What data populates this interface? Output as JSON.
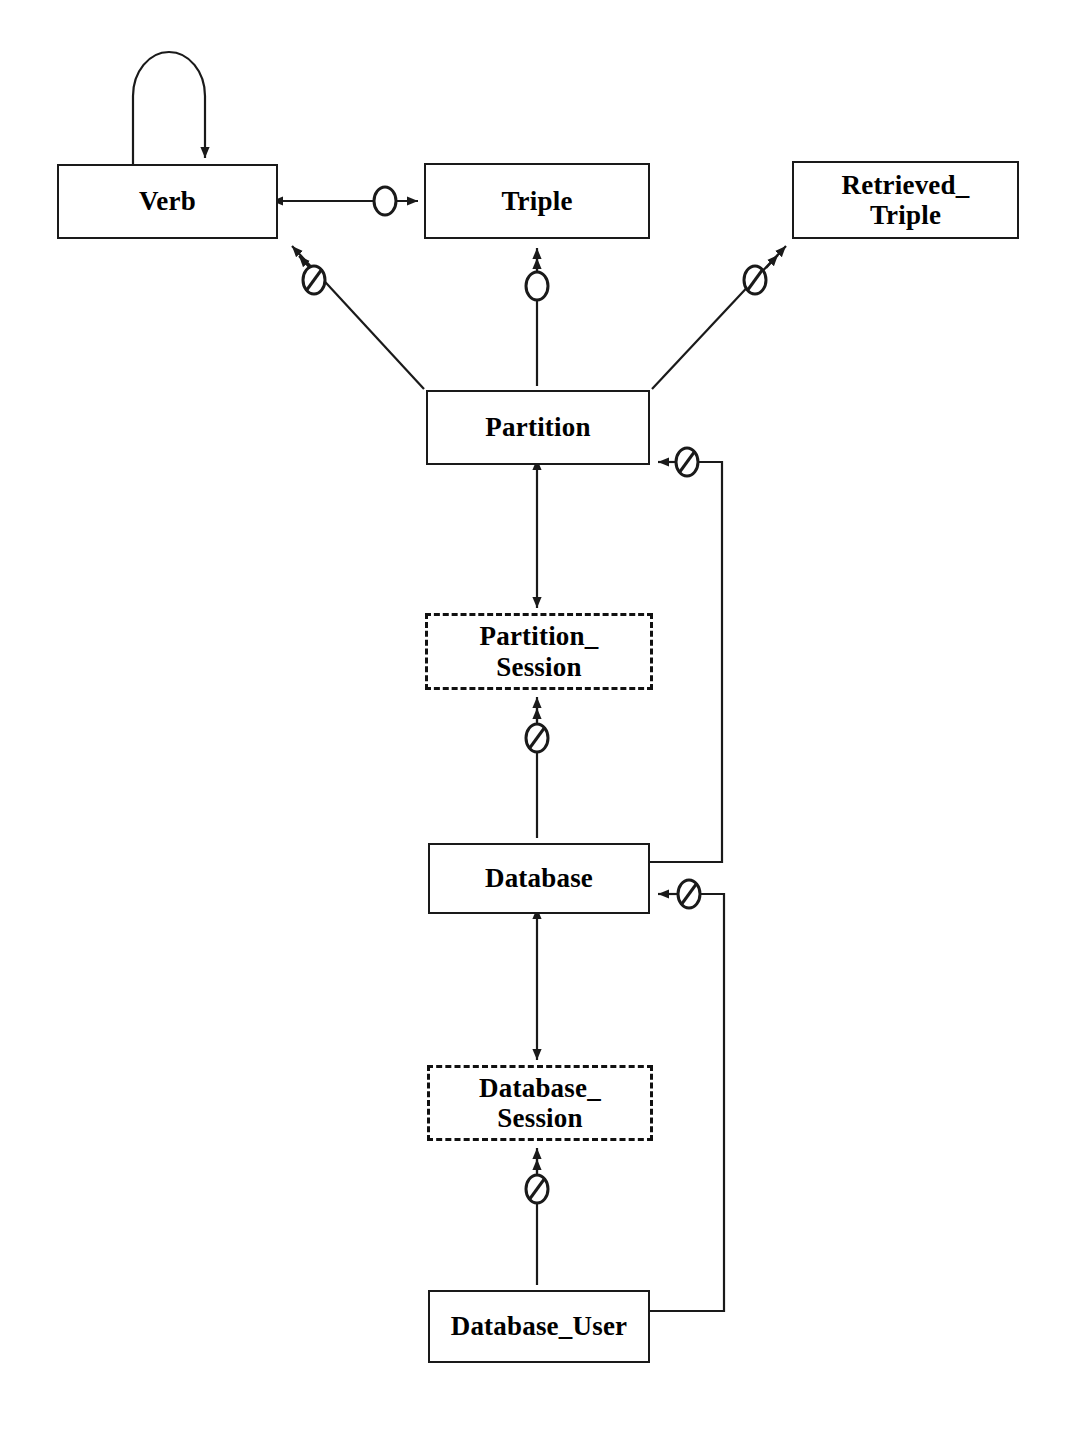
{
  "diagram": {
    "kind": "entity-relationship",
    "line_color": "#1a1a1a",
    "background_color": "#ffffff",
    "box_fill": "#ffffff",
    "text_color": "#000000",
    "entities": [
      {
        "id": "verb",
        "label": "Verb",
        "style": "solid",
        "x": 57,
        "y": 164,
        "width": 221,
        "height": 75
      },
      {
        "id": "triple",
        "label": "Triple",
        "style": "solid",
        "x": 424,
        "y": 163,
        "width": 226,
        "height": 76
      },
      {
        "id": "retrieved_triple",
        "label": "Retrieved_\nTriple",
        "style": "solid",
        "x": 792,
        "y": 161,
        "width": 227,
        "height": 78
      },
      {
        "id": "partition",
        "label": "Partition",
        "style": "solid",
        "x": 426,
        "y": 390,
        "width": 224,
        "height": 75
      },
      {
        "id": "partition_session",
        "label": "Partition_\nSession",
        "style": "dashed",
        "x": 425,
        "y": 613,
        "width": 228,
        "height": 77
      },
      {
        "id": "database",
        "label": "Database",
        "style": "solid",
        "x": 428,
        "y": 843,
        "width": 222,
        "height": 71
      },
      {
        "id": "database_session",
        "label": "Database_\nSession",
        "style": "dashed",
        "x": 427,
        "y": 1065,
        "width": 226,
        "height": 76
      },
      {
        "id": "database_user",
        "label": "Database_User",
        "style": "solid",
        "x": 428,
        "y": 1290,
        "width": 222,
        "height": 73
      }
    ],
    "relationships": [
      {
        "id": "verb-self",
        "from": "verb",
        "to": "verb",
        "marker": "none",
        "arrows": "one-way",
        "shape": "self-loop"
      },
      {
        "id": "verb-triple",
        "from": "verb",
        "to": "triple",
        "marker": "circle",
        "arrows": "two-way",
        "shape": "horizontal"
      },
      {
        "id": "partition-verb",
        "from": "partition",
        "to": "verb",
        "marker": "circle-slashed",
        "arrows": "double-head-toward-verb",
        "shape": "diagonal"
      },
      {
        "id": "partition-triple",
        "from": "partition",
        "to": "triple",
        "marker": "circle",
        "arrows": "double-head-toward-triple",
        "shape": "vertical"
      },
      {
        "id": "partition-retrieved-triple",
        "from": "partition",
        "to": "retrieved_triple",
        "marker": "circle-slashed",
        "arrows": "double-head-toward-retrieved",
        "shape": "diagonal"
      },
      {
        "id": "partition-partition-session",
        "from": "partition",
        "to": "partition_session",
        "marker": "none",
        "arrows": "two-way",
        "shape": "vertical"
      },
      {
        "id": "partition-session-database",
        "from": "partition_session",
        "to": "database",
        "marker": "circle-slashed",
        "arrows": "double-head-toward-session",
        "shape": "vertical"
      },
      {
        "id": "database-partition",
        "from": "database",
        "to": "partition",
        "marker": "circle-slashed",
        "arrows": "one-way",
        "shape": "orthogonal-right"
      },
      {
        "id": "database-database-session",
        "from": "database",
        "to": "database_session",
        "marker": "none",
        "arrows": "two-way",
        "shape": "vertical"
      },
      {
        "id": "database-session-database-user",
        "from": "database_session",
        "to": "database_user",
        "marker": "circle-slashed",
        "arrows": "double-head-toward-session",
        "shape": "vertical"
      },
      {
        "id": "database-user-database",
        "from": "database_user",
        "to": "database",
        "marker": "circle-slashed",
        "arrows": "one-way",
        "shape": "orthogonal-right"
      }
    ]
  }
}
